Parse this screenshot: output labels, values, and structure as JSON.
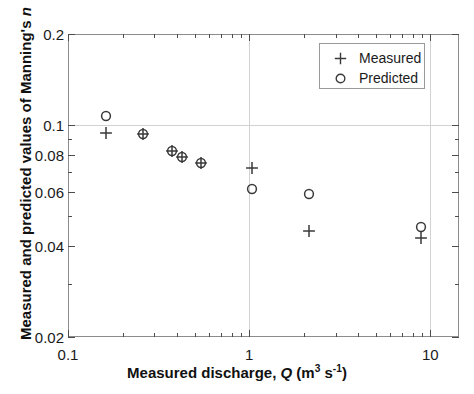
{
  "figure": {
    "background_color": "#ffffff",
    "axis_color": "#8c8c8c",
    "grid_color": "#d2d2d2",
    "marker_color": "#3a3a3a"
  },
  "axis": {
    "x_title_prefix": "Measured discharge, ",
    "x_title_symbol": "Q",
    "x_title_units_open": " (m",
    "x_title_units_exp1": "3",
    "x_title_units_mid": " s",
    "x_title_units_exp2": "-1",
    "x_title_units_close": ")",
    "x_title_full": "Measured discharge, Q (m3 s-1)",
    "y_title_prefix": "Measured and predicted values of Manning's ",
    "y_title_symbol": "n",
    "y_title_full": "Measured and predicted values of Manning's n"
  },
  "legend": {
    "position": "top-right-inside",
    "entries": [
      {
        "marker": "plus-marker",
        "label": "Measured"
      },
      {
        "marker": "circle-marker",
        "label": "Predicted"
      }
    ]
  },
  "chart_data": {
    "type": "scatter",
    "title": "",
    "xlabel": "Measured discharge, Q (m3 s-1)",
    "ylabel": "Measured and predicted values of Manning's n",
    "xscale": "log",
    "yscale": "log",
    "xlim": [
      0.1,
      14.4
    ],
    "ylim": [
      0.02,
      0.2
    ],
    "xticks": [
      0.1,
      1,
      10
    ],
    "xtick_labels": [
      "0.1",
      "1",
      "10"
    ],
    "yticks": [
      0.02,
      0.04,
      0.06,
      0.08,
      0.1,
      0.2
    ],
    "ytick_labels": [
      "0.02",
      "0.04",
      "0.06",
      "0.08",
      "0.1",
      "0.2"
    ],
    "grid": true,
    "grid_lines_x": [
      1,
      10
    ],
    "grid_lines_y": [
      0.1
    ],
    "legend_position": "upper right",
    "series": [
      {
        "name": "Measured",
        "marker": "plus",
        "x": [
          0.163,
          0.258,
          0.375,
          0.425,
          0.545,
          1.03,
          2.13,
          8.9
        ],
        "y": [
          0.0945,
          0.0935,
          0.0825,
          0.0785,
          0.0752,
          0.0725,
          0.0447,
          0.0425
        ]
      },
      {
        "name": "Predicted",
        "marker": "circle",
        "x": [
          0.163,
          0.258,
          0.375,
          0.425,
          0.545,
          1.03,
          2.13,
          8.9
        ],
        "y": [
          0.1075,
          0.0935,
          0.0825,
          0.0785,
          0.0752,
          0.0617,
          0.0592,
          0.0462
        ]
      }
    ]
  }
}
